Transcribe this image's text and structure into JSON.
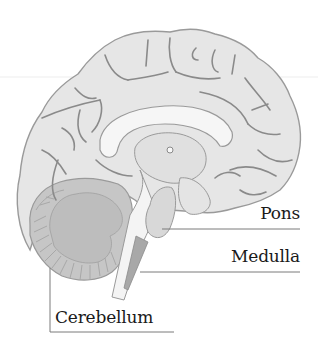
{
  "diagram": {
    "type": "anatomical-diagram",
    "labels": [
      {
        "id": "pons",
        "text": "Pons"
      },
      {
        "id": "medulla",
        "text": "Medulla"
      },
      {
        "id": "cerebellum",
        "text": "Cerebellum"
      }
    ],
    "colors": {
      "cortex_fill": "#e6e6e6",
      "sulci_stroke": "#8a8a8a",
      "outline": "#9a9a9a",
      "cerebellum_fill": "#c6c6c6",
      "cerebellum_folia": "#b4b4b4",
      "corpus_callosum": "#f6f6f6",
      "brainstem_fill": "#dcdcdc",
      "medulla_fill": "#a8a8a8",
      "leader_line": "#7a7a7a",
      "label_text": "#1a1a1a",
      "background": "#ffffff"
    }
  }
}
